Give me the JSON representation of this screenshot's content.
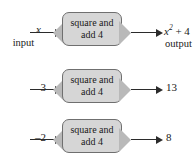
{
  "figure": {
    "type": "function-machine-diagram",
    "background_color": "#ffffff",
    "box_fill_color": "#d6d6d6",
    "box_border_color": "#6f6f6f",
    "funnel_color": "#b9b9b9",
    "arrow_color": "#2b2b2b"
  },
  "machine": {
    "line1": "square and",
    "line2": "add 4"
  },
  "rows": [
    {
      "input": "x",
      "input_sublabel": "input",
      "output_base": "x",
      "output_exponent": "2",
      "output_rest": "+ 4",
      "output_sublabel": "output"
    },
    {
      "input": "3",
      "input_sublabel": "",
      "output_base": "13",
      "output_exponent": "",
      "output_rest": "",
      "output_sublabel": ""
    },
    {
      "input": "–2",
      "input_sublabel": "",
      "output_base": "8",
      "output_exponent": "",
      "output_rest": "",
      "output_sublabel": ""
    }
  ]
}
